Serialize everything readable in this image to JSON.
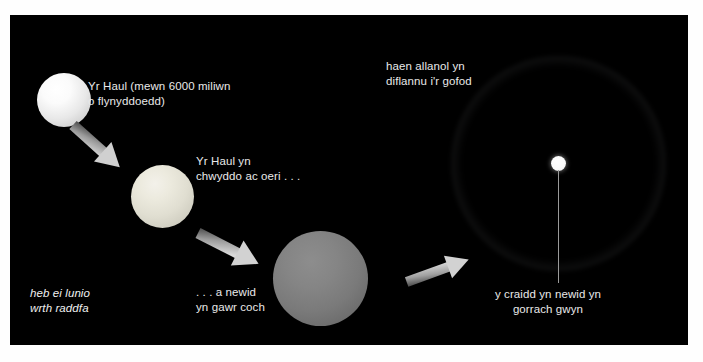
{
  "figure": {
    "background_color": "#ffffff",
    "panel_color": "#000000",
    "text_color": "#e9e9e9"
  },
  "labels": {
    "sun": "Yr Haul (mewn 6000 miliwn\no flynyddoedd)",
    "swelling": "Yr Haul yn\nchwyddo ac oeri . . .",
    "red_giant": ". . . a newid\nyn gawr coch",
    "outer_layer": "haen allanol yn\ndiflannu i'r gofod",
    "white_dwarf": "y craidd yn newid yn\ngorrach gwyn",
    "not_to_scale": "heb ei lunio\nwrth raddfa"
  },
  "stages": [
    {
      "name": "sun",
      "label": "Yr Haul (mewn 6000 miliwn o flynyddoedd)",
      "color": "#ffffff",
      "radius_px": 27
    },
    {
      "name": "swelling-sun",
      "label": "Yr Haul yn chwyddo ac oeri . . .",
      "color": "#ecead e",
      "radius_px": 31
    },
    {
      "name": "red-giant",
      "label": ". . . a newid yn gawr coch",
      "color": "#858585",
      "radius_px": 47
    },
    {
      "name": "planetary-nebula",
      "label": "haen allanol yn diflannu i'r gofod",
      "color": "#d7dce2",
      "radius_px": 107
    },
    {
      "name": "white-dwarf",
      "label": "y craidd yn newid yn gorrach gwyn",
      "color": "#ffffff",
      "radius_px": 7
    }
  ],
  "arrows": [
    {
      "name": "arrow-sun-to-swelling",
      "direction": "down-right"
    },
    {
      "name": "arrow-swelling-to-giant",
      "direction": "down-right"
    },
    {
      "name": "arrow-giant-to-nebula",
      "direction": "up-right"
    }
  ]
}
